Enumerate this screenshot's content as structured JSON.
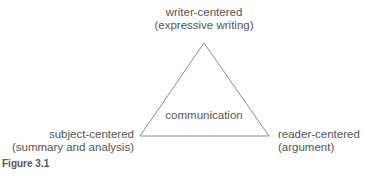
{
  "diagram": {
    "type": "triangle",
    "top": {
      "line1": "writer-centered",
      "line2": "(expressive writing)"
    },
    "bottom_left": {
      "line1": "subject-centered",
      "line2": "(summary and analysis)"
    },
    "bottom_right": {
      "line1": "reader-centered",
      "line2": "(argument)"
    },
    "center": "communication",
    "caption": "Figure 3.1",
    "stroke_color": "#888888"
  }
}
